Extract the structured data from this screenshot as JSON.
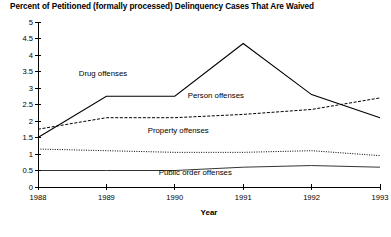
{
  "chart_data": {
    "type": "line",
    "title": "Percent of Petitioned (formally processed) Delinquency Cases That Are Waived",
    "xlabel": "Year",
    "ylabel": "",
    "x": [
      1988,
      1989,
      1990,
      1991,
      1992,
      1993
    ],
    "categories": [
      "1988",
      "1989",
      "1990",
      "1991",
      "1992",
      "1993"
    ],
    "xlim": [
      1988,
      1993
    ],
    "ylim": [
      0,
      5
    ],
    "ytick_labels": [
      "0",
      "0.5",
      "1",
      "1.5",
      "2",
      "2.5",
      "3",
      "3.5",
      "4",
      "4.5",
      "5"
    ],
    "ytick_values": [
      0,
      0.5,
      1,
      1.5,
      2,
      2.5,
      3,
      3.5,
      4,
      4.5,
      5
    ],
    "xtick_labels": [
      "1988",
      "1989",
      "1990",
      "1991",
      "1992",
      "1993"
    ],
    "grid": false,
    "legend_position": "inline-annotations",
    "series": [
      {
        "name": "Drug offenses",
        "style": "solid",
        "values": [
          1.5,
          2.75,
          2.75,
          4.35,
          2.8,
          2.1
        ],
        "label_x": 1988.95,
        "label_y": 3.35
      },
      {
        "name": "Person offenses",
        "style": "dashed",
        "values": [
          1.75,
          2.1,
          2.1,
          2.2,
          2.35,
          2.7
        ],
        "label_x": 1990.6,
        "label_y": 2.7
      },
      {
        "name": "Property offenses",
        "style": "dotted",
        "values": [
          1.15,
          1.1,
          1.05,
          1.05,
          1.1,
          0.95
        ],
        "label_x": 1990.05,
        "label_y": 1.65
      },
      {
        "name": "Public order offenses",
        "style": "solid-thin",
        "values": [
          0.5,
          0.5,
          0.5,
          0.6,
          0.65,
          0.6
        ],
        "label_x": 1990.3,
        "label_y": 0.35
      }
    ]
  },
  "colors": {
    "axis": "#000000",
    "series": "#000000",
    "background": "#ffffff"
  }
}
